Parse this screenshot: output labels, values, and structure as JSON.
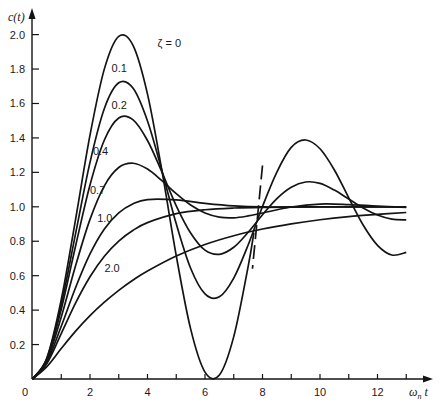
{
  "chart_data": {
    "type": "line",
    "title": "",
    "xlabel": "ω_n t",
    "ylabel": "c(t)",
    "xlim": [
      0,
      13.5
    ],
    "ylim": [
      0,
      2.1
    ],
    "grid": false,
    "legend": "inline labels",
    "x_ticks": [
      0,
      1,
      2,
      3,
      4,
      5,
      6,
      7,
      8,
      9,
      10,
      11,
      12,
      13
    ],
    "x_tick_labels": [
      "0",
      "2",
      "4",
      "6",
      "8",
      "10",
      "12"
    ],
    "x_tick_label_values": [
      0,
      2,
      4,
      6,
      8,
      10,
      12
    ],
    "y_tick_values": [
      0.2,
      0.4,
      0.6,
      0.8,
      1.0,
      1.2,
      1.4,
      1.6,
      1.8,
      2.0
    ],
    "y_tick_labels": [
      "0.2",
      "0.4",
      "0.6",
      "0.8",
      "1.0",
      "1.2",
      "1.4",
      "1.6",
      "1.8",
      "2.0"
    ],
    "series": [
      {
        "name": "ζ = 0",
        "label": "ζ = 0",
        "label_pos": [
          4.35,
          1.93
        ],
        "x": [
          0,
          0.5,
          1,
          1.5,
          2,
          2.5,
          3,
          3.5,
          4,
          4.5,
          5,
          5.5,
          6,
          6.5,
          7,
          7.5,
          7.7
        ],
        "values": [
          0,
          0.122,
          0.46,
          0.929,
          1.416,
          1.801,
          1.99,
          1.936,
          1.654,
          1.211,
          0.716,
          0.291,
          0.04,
          0.023,
          0.246,
          0.653,
          0.85
        ]
      },
      {
        "name": "ζ = 0.1",
        "label": "0.1",
        "label_pos": [
          2.75,
          1.78
        ],
        "x": [
          0,
          0.5,
          1,
          1.5,
          2,
          2.5,
          3,
          3.5,
          4,
          4.5,
          5,
          5.5,
          6,
          6.5,
          7,
          7.5,
          8,
          8.5,
          9,
          9.5,
          10,
          10.5,
          11,
          11.5,
          12,
          12.5,
          13
        ],
        "values": [
          0,
          0.118,
          0.431,
          0.846,
          1.258,
          1.571,
          1.72,
          1.688,
          1.498,
          1.211,
          0.901,
          0.643,
          0.494,
          0.477,
          0.586,
          0.778,
          1.002,
          1.202,
          1.345,
          1.388,
          1.337,
          1.214,
          1.052,
          0.894,
          0.776,
          0.72,
          0.735
        ]
      },
      {
        "name": "ζ = 0.2",
        "label": "0.2",
        "label_pos": [
          2.75,
          1.57
        ],
        "x": [
          0,
          0.5,
          1,
          1.5,
          2,
          2.5,
          3,
          3.5,
          4,
          4.5,
          5,
          5.5,
          6,
          6.5,
          7,
          7.5,
          8,
          8.5,
          9,
          9.5,
          10,
          10.5,
          11,
          11.5,
          12,
          12.5,
          13
        ],
        "values": [
          0,
          0.115,
          0.405,
          0.774,
          1.127,
          1.388,
          1.516,
          1.505,
          1.385,
          1.202,
          1.006,
          0.848,
          0.748,
          0.724,
          0.765,
          0.852,
          0.954,
          1.048,
          1.114,
          1.144,
          1.136,
          1.097,
          1.045,
          0.993,
          0.952,
          0.928,
          0.924
        ]
      },
      {
        "name": "ζ = 0.4",
        "label": "0.4",
        "label_pos": [
          2.1,
          1.3
        ],
        "x": [
          0,
          0.5,
          1,
          1.5,
          2,
          2.5,
          3,
          3.5,
          4,
          4.5,
          5,
          5.5,
          6,
          6.5,
          7,
          7.5,
          8,
          9,
          10,
          11,
          12,
          13
        ],
        "values": [
          0,
          0.108,
          0.36,
          0.659,
          0.927,
          1.122,
          1.228,
          1.253,
          1.219,
          1.152,
          1.076,
          1.01,
          0.964,
          0.94,
          0.936,
          0.947,
          0.964,
          0.999,
          1.016,
          1.013,
          1.004,
          0.997
        ]
      },
      {
        "name": "ζ = 0.7",
        "label": "0.7",
        "label_pos": [
          2.0,
          1.075
        ],
        "x": [
          0,
          0.5,
          1,
          1.5,
          2,
          2.5,
          3,
          3.5,
          4,
          5,
          6,
          7,
          8,
          10,
          13
        ],
        "values": [
          0,
          0.098,
          0.306,
          0.531,
          0.726,
          0.871,
          0.965,
          1.018,
          1.042,
          1.04,
          1.02,
          1.005,
          0.999,
          1.0,
          1.0
        ]
      },
      {
        "name": "ζ = 1.0",
        "label": "1.0",
        "label_pos": [
          2.25,
          0.91
        ],
        "x": [
          0,
          0.5,
          1,
          1.5,
          2,
          2.5,
          3,
          3.5,
          4,
          5,
          6,
          7,
          8,
          10,
          13
        ],
        "values": [
          0,
          0.09,
          0.264,
          0.442,
          0.594,
          0.713,
          0.801,
          0.864,
          0.908,
          0.96,
          0.983,
          0.993,
          0.997,
          0.9995,
          1.0
        ]
      },
      {
        "name": "ζ = 2.0",
        "label": "2.0",
        "label_pos": [
          2.5,
          0.62
        ],
        "x": [
          0,
          0.5,
          1,
          1.5,
          2,
          2.5,
          3,
          3.5,
          4,
          5,
          6,
          7,
          8,
          9,
          10,
          11,
          12,
          13
        ],
        "values": [
          0,
          0.072,
          0.177,
          0.278,
          0.368,
          0.446,
          0.515,
          0.575,
          0.627,
          0.714,
          0.781,
          0.832,
          0.871,
          0.901,
          0.925,
          0.943,
          0.956,
          0.967
        ]
      }
    ],
    "annotations": [
      {
        "type": "dashed-line",
        "from": [
          8.0,
          1.24
        ],
        "to": [
          7.65,
          0.64
        ]
      }
    ]
  },
  "axes": {
    "x_title": "ω",
    "x_title_sub": "n",
    "x_title_suffix": " t",
    "y_title": "c(t)",
    "origin_label": "0"
  }
}
